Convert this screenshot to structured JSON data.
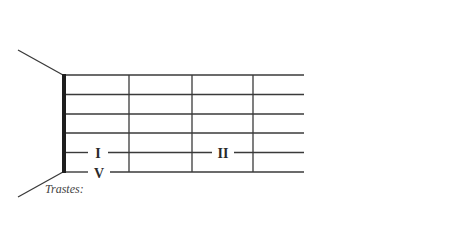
{
  "diagram": {
    "type": "guitar-fretboard",
    "strings_count": 6,
    "frets_shown": 3,
    "caption": "Trastes:",
    "labels": [
      {
        "text": "I",
        "string": 5,
        "position": "fret-1"
      },
      {
        "text": "II",
        "string": 5,
        "position": "fret-2"
      },
      {
        "text": "V",
        "string": 6,
        "position": "fret-1"
      }
    ],
    "colors": {
      "line": "#3a3a3a",
      "nut": "#1e1e1e",
      "text": "#2a2a2a",
      "background": "#ffffff"
    }
  }
}
